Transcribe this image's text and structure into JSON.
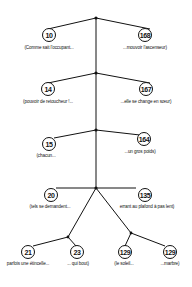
{
  "diagram": {
    "type": "tree",
    "nodes": [
      {
        "id": "10",
        "label": "(Comme sait l'occupant..."
      },
      {
        "id": "168",
        "label": "...mouvoir l'ascenseur)"
      },
      {
        "id": "14",
        "label": "(pouvoir de retoucheur !..."
      },
      {
        "id": "167",
        "label": "...elle se change en sœur)"
      },
      {
        "id": "15",
        "label": "(chacun..."
      },
      {
        "id": "164",
        "label": "...un gros poids)"
      },
      {
        "id": "20",
        "label": "(tels se demandent..."
      },
      {
        "id": "135",
        "label": "errant au plafond à pas lent)"
      },
      {
        "id": "21",
        "label": "parfois une étincelle..."
      },
      {
        "id": "23",
        "label": "... qui bout)"
      },
      {
        "id": "129a",
        "display": "129",
        "label": "(le soleil..."
      },
      {
        "id": "129b",
        "display": "129",
        "label": "...marbre)"
      }
    ],
    "line_color": "#111111",
    "background": "#ffffff"
  }
}
